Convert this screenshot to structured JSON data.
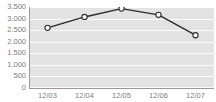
{
  "widget": {
    "title_fragment": "",
    "background_color": "#ffffff"
  },
  "chart_data": {
    "type": "line",
    "title": "",
    "subtitle": "",
    "xlabel": "",
    "ylabel": "",
    "categories": [
      "12/03",
      "12/04",
      "12/05",
      "12/06",
      "12/07"
    ],
    "values": [
      2600,
      3070,
      3430,
      3160,
      2280
    ],
    "series": [
      {
        "name": "",
        "values": [
          2600,
          3070,
          3430,
          3160,
          2280
        ]
      }
    ],
    "ylim": [
      0,
      3500
    ],
    "ytick_values": [
      0,
      500,
      1000,
      1500,
      2000,
      2500,
      3000,
      3500
    ],
    "ytick_labels": [
      "0",
      "500",
      "1.000",
      "1.500",
      "2.000",
      "2.500",
      "3.000",
      "3.500"
    ],
    "xtick_labels": [
      "12/03",
      "12/04",
      "12/05",
      "12/06",
      "12/07"
    ],
    "grid": {
      "horizontal": true,
      "vertical": false,
      "color": "#fbfbfb"
    },
    "legend": {
      "visible": false,
      "position": "none",
      "entries": []
    },
    "annotations": [],
    "colors": {
      "line": "#2b2b2b",
      "marker_fill": "#ffffff",
      "marker_stroke": "#2b2b2b",
      "plot_background": "#e3e3e3",
      "axis": "#9a9a9a",
      "tick_label": "#7d7d7d"
    },
    "marker_style": "open-circle"
  }
}
